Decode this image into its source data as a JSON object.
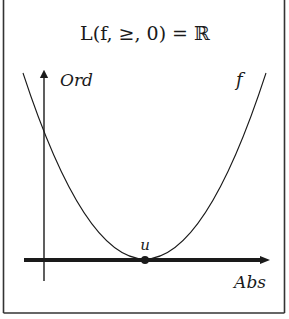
{
  "title": "L(f, ≥, 0) = ℝ",
  "labels": {
    "y_axis": "Ord",
    "x_axis": "Abs",
    "curve": "f",
    "vertex": "u"
  },
  "colors": {
    "ink": "#1a1a1a",
    "frame": "#333333",
    "background": "#ffffff"
  }
}
